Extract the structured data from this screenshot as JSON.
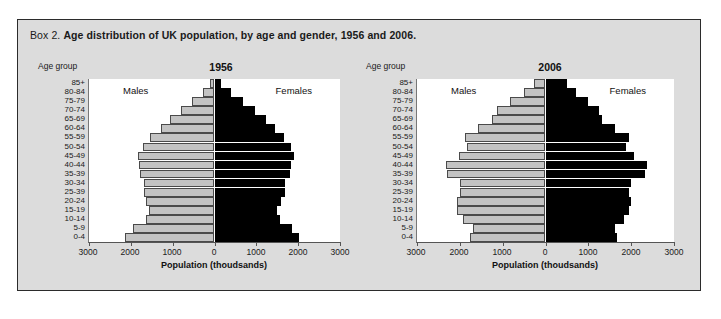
{
  "figure": {
    "caption_lead": "Box 2.",
    "caption_main": "Age distribution of UK population, by age and gender, 1956 and 2006.",
    "background_color": "#dcdcdc",
    "border_color": "#2b2b2b"
  },
  "labels": {
    "age_group_heading": "Age group",
    "males": "Males",
    "females": "Females",
    "xaxis_title": "Population (thoudsands)"
  },
  "colors": {
    "male_fill": "#c3c3c3",
    "male_stroke": "#4a4a4a",
    "female_fill": "#000000",
    "plot_background": "#ffffff"
  },
  "chart_data": [
    {
      "type": "bar",
      "orientation": "horizontal",
      "subtype": "population-pyramid",
      "title": "1956",
      "xlabel": "Population (thoudsands)",
      "ylabel": "Age group",
      "xlim": [
        -3000,
        3000
      ],
      "xticks": [
        -3000,
        -2000,
        -1000,
        0,
        1000,
        2000,
        3000
      ],
      "xtick_labels": [
        "3000",
        "2000",
        "1000",
        "0",
        "1000",
        "2000",
        "3000"
      ],
      "grid": false,
      "legend_position": "inside-top",
      "categories": [
        "0-4",
        "5-9",
        "10-14",
        "15-19",
        "20-24",
        "25-39",
        "30-34",
        "35-39",
        "40-44",
        "45-49",
        "50-54",
        "55-59",
        "60-64",
        "65-69",
        "70-74",
        "75-79",
        "80-84",
        "85+"
      ],
      "series": [
        {
          "name": "Males",
          "side": "left",
          "values": [
            2130,
            1950,
            1630,
            1560,
            1640,
            1690,
            1680,
            1790,
            1800,
            1840,
            1720,
            1530,
            1290,
            1060,
            800,
            530,
            280,
            100
          ]
        },
        {
          "name": "Females",
          "side": "right",
          "values": [
            2020,
            1860,
            1560,
            1500,
            1600,
            1680,
            1690,
            1810,
            1840,
            1900,
            1820,
            1660,
            1450,
            1230,
            960,
            680,
            390,
            160
          ]
        }
      ]
    },
    {
      "type": "bar",
      "orientation": "horizontal",
      "subtype": "population-pyramid",
      "title": "2006",
      "xlabel": "Population (thoudsands)",
      "ylabel": "Age group",
      "xlim": [
        -3000,
        3000
      ],
      "xticks": [
        -3000,
        -2000,
        -1000,
        0,
        1000,
        2000,
        3000
      ],
      "xtick_labels": [
        "3000",
        "2000",
        "1000",
        "0",
        "1000",
        "2000",
        "3000"
      ],
      "grid": false,
      "legend_position": "inside-top",
      "categories": [
        "0-4",
        "5-9",
        "10-14",
        "15-19",
        "20-24",
        "25-39",
        "30-34",
        "35-39",
        "40-44",
        "45-49",
        "50-54",
        "55-59",
        "60-64",
        "65-69",
        "70-74",
        "75-79",
        "80-84",
        "85+"
      ],
      "series": [
        {
          "name": "Males",
          "side": "left",
          "values": [
            1760,
            1700,
            1920,
            2060,
            2060,
            1990,
            1990,
            2290,
            2330,
            2030,
            1830,
            1890,
            1570,
            1250,
            1130,
            830,
            510,
            260
          ]
        },
        {
          "name": "Females",
          "side": "right",
          "values": [
            1680,
            1620,
            1830,
            1960,
            1990,
            1960,
            2000,
            2320,
            2370,
            2070,
            1880,
            1940,
            1630,
            1320,
            1250,
            1000,
            720,
            500
          ]
        }
      ]
    }
  ]
}
